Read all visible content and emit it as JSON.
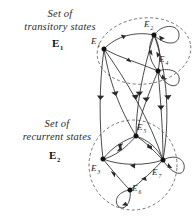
{
  "figure": {
    "background_color": "#ffffff",
    "ink_color": "#2a2a2a",
    "region_stroke_color": "#5a5a5a"
  },
  "annotations": [
    {
      "id": "transitory-caption",
      "line1": "Set of",
      "line2": "transitory states",
      "set_symbol": "E",
      "set_subscript": "1"
    },
    {
      "id": "recurrent-caption",
      "line1": "Set of",
      "line2": "recurrent states",
      "set_symbol": "E",
      "set_subscript": "2"
    }
  ],
  "regions": [
    {
      "id": "transitory-region",
      "name": "Set of transitory states E1",
      "style": "dashed-ellipse",
      "members": [
        "E1",
        "E2",
        "E4"
      ]
    },
    {
      "id": "recurrent-region",
      "name": "Set of recurrent states E2",
      "style": "dashed-ellipse",
      "members": [
        "E3",
        "E5",
        "E6",
        "E7"
      ]
    }
  ],
  "nodes": [
    {
      "id": "E1",
      "symbol": "E",
      "subscript": "1",
      "x": 104,
      "y": 49,
      "label_x": 91,
      "label_y": 44,
      "region": "transitory-region",
      "self_loop": false
    },
    {
      "id": "E2",
      "symbol": "E",
      "subscript": "2",
      "x": 154,
      "y": 35,
      "label_x": 144,
      "label_y": 27,
      "region": "transitory-region",
      "self_loop": true
    },
    {
      "id": "E4",
      "symbol": "E",
      "subscript": "4",
      "x": 158,
      "y": 71,
      "label_x": 161,
      "label_y": 62,
      "region": "transitory-region",
      "self_loop": true
    },
    {
      "id": "E5",
      "symbol": "E",
      "subscript": "5",
      "x": 136,
      "y": 136,
      "label_x": 138,
      "label_y": 130,
      "region": "recurrent-region",
      "self_loop": false
    },
    {
      "id": "E3",
      "symbol": "E",
      "subscript": "3",
      "x": 103,
      "y": 159,
      "label_x": 92,
      "label_y": 169,
      "region": "recurrent-region",
      "self_loop": false
    },
    {
      "id": "E7",
      "symbol": "E",
      "subscript": "7",
      "x": 163,
      "y": 160,
      "label_x": 154,
      "label_y": 173,
      "region": "recurrent-region",
      "self_loop": true
    },
    {
      "id": "E6",
      "symbol": "E",
      "subscript": "6",
      "x": 130,
      "y": 190,
      "label_x": 133,
      "label_y": 189,
      "region": "recurrent-region",
      "self_loop": true
    }
  ],
  "edges": [
    {
      "from": "E1",
      "to": "E2",
      "kind": "curved"
    },
    {
      "from": "E2",
      "to": "E4",
      "kind": "curved"
    },
    {
      "from": "E4",
      "to": "E2",
      "kind": "curved"
    },
    {
      "from": "E4",
      "to": "E1",
      "kind": "curved"
    },
    {
      "from": "E1",
      "to": "E3",
      "kind": "long-descending"
    },
    {
      "from": "E1",
      "to": "E5",
      "kind": "long-descending"
    },
    {
      "from": "E1",
      "to": "E7",
      "kind": "long-descending"
    },
    {
      "from": "E2",
      "to": "E5",
      "kind": "long-descending"
    },
    {
      "from": "E2",
      "to": "E7",
      "kind": "long-descending"
    },
    {
      "from": "E4",
      "to": "E5",
      "kind": "long-descending"
    },
    {
      "from": "E4",
      "to": "E7",
      "kind": "long-descending"
    },
    {
      "from": "E5",
      "to": "E3",
      "kind": "curved"
    },
    {
      "from": "E3",
      "to": "E5",
      "kind": "curved"
    },
    {
      "from": "E5",
      "to": "E7",
      "kind": "curved"
    },
    {
      "from": "E7",
      "to": "E5",
      "kind": "curved"
    },
    {
      "from": "E7",
      "to": "E3",
      "kind": "curved"
    },
    {
      "from": "E3",
      "to": "E6",
      "kind": "curved"
    },
    {
      "from": "E6",
      "to": "E7",
      "kind": "curved"
    }
  ],
  "self_loops": [
    {
      "node": "E2"
    },
    {
      "node": "E4"
    },
    {
      "node": "E6"
    },
    {
      "node": "E7"
    }
  ]
}
